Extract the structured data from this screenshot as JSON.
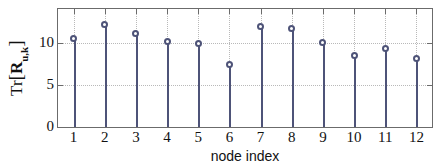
{
  "chart_data": {
    "type": "bar",
    "render_style": "stem",
    "title": "",
    "subtitle": "",
    "xlabel": "node index",
    "ylabel": "Tr[R_u,k]",
    "ylabel_parts": {
      "function": "Tr",
      "open_bracket": "[",
      "matrix": "R",
      "subscript": "u,k",
      "close_bracket": "]"
    },
    "categories": [
      "1",
      "2",
      "3",
      "4",
      "5",
      "6",
      "7",
      "8",
      "9",
      "10",
      "11",
      "12"
    ],
    "x": [
      1,
      2,
      3,
      4,
      5,
      6,
      7,
      8,
      9,
      10,
      11,
      12
    ],
    "values": [
      10.6,
      12.2,
      11.2,
      10.25,
      10.0,
      7.5,
      12.0,
      11.75,
      10.15,
      8.5,
      9.4,
      8.2
    ],
    "xlim": [
      0.5,
      12.5
    ],
    "ylim": [
      0,
      14.1
    ],
    "yticks": [
      0,
      5,
      10
    ],
    "ytick_labels": [
      "0",
      "5",
      "10"
    ],
    "xticks": [
      1,
      2,
      3,
      4,
      5,
      6,
      7,
      8,
      9,
      10,
      11,
      12
    ],
    "xtick_labels": [
      "1",
      "2",
      "3",
      "4",
      "5",
      "6",
      "7",
      "8",
      "9",
      "10",
      "11",
      "12"
    ],
    "grid": true,
    "grid_style": "dotted",
    "legend": null,
    "legend_position": "none",
    "series": [
      {
        "name": "Tr[R_u,k]",
        "marker": "circle-open",
        "values": [
          10.6,
          12.2,
          11.2,
          10.25,
          10.0,
          7.5,
          12.0,
          11.75,
          10.15,
          8.5,
          9.4,
          8.2
        ]
      }
    ],
    "colors": {
      "stem": "#4e5378",
      "marker_edge": "#4e5378",
      "marker_face": "#ffffff",
      "axis": "#6b6b6b",
      "grid": "#b9b9b9",
      "text": "#111111",
      "background": "#ffffff"
    }
  }
}
